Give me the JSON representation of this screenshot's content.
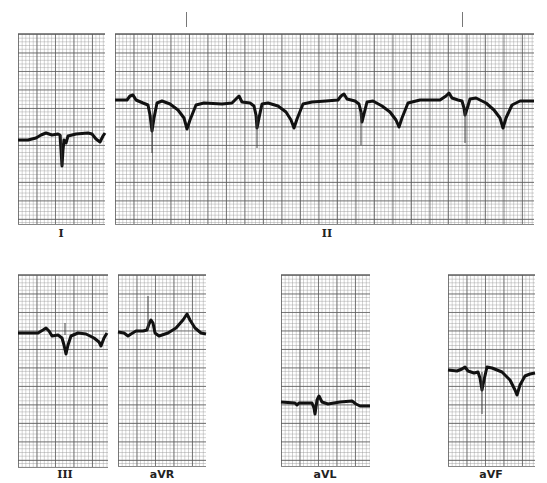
{
  "figure": {
    "type": "12-lead ECG limb lead strips",
    "leads": [
      {
        "id": "I",
        "label": "I"
      },
      {
        "id": "II",
        "label": "II"
      },
      {
        "id": "III",
        "label": "III"
      },
      {
        "id": "aVR",
        "label": "aVR"
      },
      {
        "id": "aVL",
        "label": "aVL"
      },
      {
        "id": "aVF",
        "label": "aVF"
      }
    ],
    "timing_marks": 2,
    "colors": {
      "trace": "#111111",
      "grid_major": "#5a5a5a",
      "grid_minor": "#969696",
      "paper": "#ffffff"
    }
  }
}
